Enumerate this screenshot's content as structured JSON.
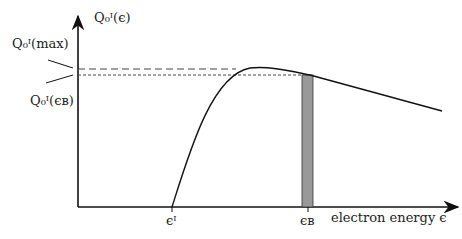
{
  "diagram": {
    "y_axis_label": "Q₀ᴵ(ϵ)",
    "y_label_max": "Q₀ᴵ(max)",
    "y_label_eb": "Q₀ᴵ(ϵʙ)",
    "x_axis_label": "electron energy ϵ",
    "tick_ei": "ϵᴵ",
    "tick_eb": "ϵʙ",
    "colors": {
      "line": "#111111",
      "bar": "#999999"
    }
  }
}
